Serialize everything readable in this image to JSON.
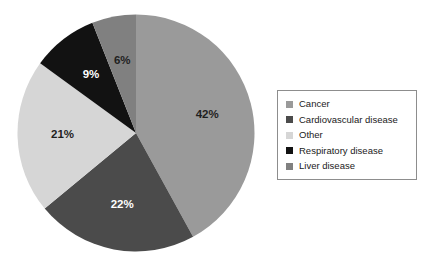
{
  "chart_data": {
    "type": "pie",
    "title": "",
    "subtitle": "",
    "xlabel": "",
    "ylabel": "",
    "grid": false,
    "legend_position": "right",
    "start_angle_deg": 0,
    "direction": "clockwise",
    "units": "percent",
    "categories": [
      "Cancer",
      "Cardiovascular disease",
      "Other",
      "Respiratory disease",
      "Liver disease"
    ],
    "values": [
      42,
      22,
      21,
      9,
      6
    ],
    "data_labels": [
      "42%",
      "22%",
      "21%",
      "9%",
      "6%"
    ],
    "slice_colors": [
      "#9a9a9a",
      "#4b4b4b",
      "#d6d6d6",
      "#121212",
      "#808080"
    ],
    "slice_label_colors": [
      "#1f1f1f",
      "#ffffff",
      "#1f1f1f",
      "#ffffff",
      "#1f1f1f"
    ],
    "slices": [
      {
        "label": "Cancer",
        "value": 42,
        "data_label": "42%",
        "color": "#9a9a9a",
        "label_color": "#1f1f1f"
      },
      {
        "label": "Cardiovascular disease",
        "value": 22,
        "data_label": "22%",
        "color": "#4b4b4b",
        "label_color": "#ffffff"
      },
      {
        "label": "Other",
        "value": 21,
        "data_label": "21%",
        "color": "#d6d6d6",
        "label_color": "#1f1f1f"
      },
      {
        "label": "Respiratory disease",
        "value": 9,
        "data_label": "9%",
        "color": "#121212",
        "label_color": "#ffffff"
      },
      {
        "label": "Liver disease",
        "value": 6,
        "data_label": "6%",
        "color": "#808080",
        "label_color": "#1f1f1f"
      }
    ]
  },
  "legend": {
    "border_color": "#8d8d8d",
    "items": [
      {
        "label": "Cancer",
        "color": "#9a9a9a"
      },
      {
        "label": "Cardiovascular disease",
        "color": "#4b4b4b"
      },
      {
        "label": "Other",
        "color": "#d6d6d6"
      },
      {
        "label": "Respiratory disease",
        "color": "#121212"
      },
      {
        "label": "Liver disease",
        "color": "#808080"
      }
    ]
  },
  "canvas": {
    "background": "#ffffff"
  }
}
